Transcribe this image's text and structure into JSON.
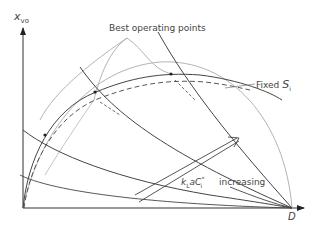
{
  "diagram": {
    "y_axis_label": "x",
    "y_axis_subscript": "vo",
    "x_axis_label": "D",
    "annotation_best": "Best operating points",
    "annotation_fixed": "Fixed",
    "annotation_fixed_symbol": "S",
    "annotation_fixed_subscript": "i",
    "arrow_label_k": "k",
    "arrow_label_k_sub": "L",
    "arrow_label_a": "aC",
    "arrow_label_c_sup": "*",
    "arrow_label_c_sub": "i",
    "arrow_label_increasing": "increasing"
  },
  "colors": {
    "axis": "#222222",
    "curve_dark": "#444444",
    "curve_light": "#aaaaaa",
    "text": "#444444"
  }
}
